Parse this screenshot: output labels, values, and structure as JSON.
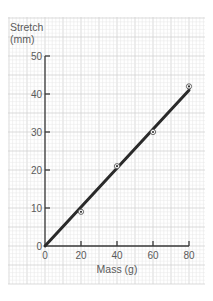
{
  "chart_data": {
    "type": "scatter",
    "title": "",
    "xlabel": "Mass (g)",
    "ylabel": "Stretch (mm)",
    "ylabel_lines": [
      "Stretch",
      "(mm)"
    ],
    "xlim": [
      0,
      80
    ],
    "ylim": [
      0,
      50
    ],
    "x_ticks": [
      0,
      20,
      40,
      60,
      80
    ],
    "y_ticks": [
      0,
      10,
      20,
      30,
      40,
      50
    ],
    "grid": true,
    "legend": null,
    "series": [
      {
        "name": "Measured points",
        "kind": "scatter",
        "marker": "circled-dot",
        "x": [
          20,
          40,
          60,
          80
        ],
        "y": [
          9,
          21,
          30,
          42
        ]
      },
      {
        "name": "Line of best fit",
        "kind": "line",
        "x": [
          0,
          80
        ],
        "y": [
          0,
          41
        ]
      }
    ]
  },
  "colors": {
    "background": "#ffffff",
    "grid_minor": "#e8e8e8",
    "grid_major": "#d2d2d2",
    "axis": "#3a3a3a",
    "line": "#2a2a2a",
    "text": "#5a5a5a"
  }
}
